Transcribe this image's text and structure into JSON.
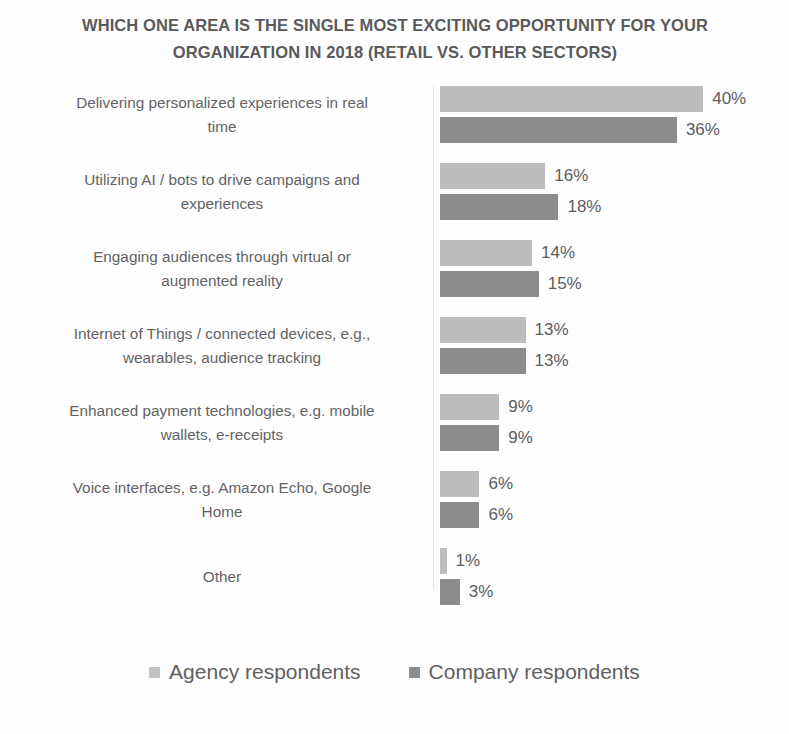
{
  "chart_data": {
    "type": "bar",
    "orientation": "horizontal",
    "title": "WHICH ONE AREA IS THE SINGLE MOST EXCITING OPPORTUNITY FOR YOUR ORGANIZATION IN 2018 (RETAIL VS. OTHER SECTORS)",
    "title_lines": [
      "WHICH ONE AREA IS THE SINGLE MOST EXCITING OPPORTUNITY FOR YOUR",
      "ORGANIZATION IN 2018 (RETAIL VS. OTHER SECTORS)"
    ],
    "xlabel": "",
    "ylabel": "",
    "xlim": [
      0,
      40
    ],
    "grid": false,
    "axis_visible": false,
    "value_suffix": "%",
    "legend_position": "bottom",
    "categories": [
      "Delivering personalized experiences in real time",
      "Utilizing AI / bots to drive campaigns and experiences",
      "Engaging audiences through virtual or augmented reality",
      "Internet of Things / connected devices, e.g., wearables, audience tracking",
      "Enhanced payment technologies, e.g. mobile wallets, e-receipts",
      "Voice interfaces, e.g. Amazon Echo, Google Home",
      "Other"
    ],
    "category_lines": [
      [
        "Delivering personalized experiences in real",
        "time"
      ],
      [
        "Utilizing AI / bots to drive campaigns and",
        "experiences"
      ],
      [
        "Engaging audiences through virtual or",
        "augmented reality"
      ],
      [
        "Internet of Things / connected devices, e.g.,",
        "wearables, audience tracking"
      ],
      [
        "Enhanced payment technologies, e.g. mobile",
        "wallets, e-receipts"
      ],
      [
        "Voice interfaces, e.g. Amazon Echo, Google",
        "Home"
      ],
      [
        "Other"
      ]
    ],
    "series": [
      {
        "name": "Agency respondents",
        "color": "#bcbcbc",
        "values": [
          40,
          16,
          14,
          13,
          9,
          6,
          1
        ],
        "value_labels": [
          "40%",
          "16%",
          "14%",
          "13%",
          "9%",
          "6%",
          "1%"
        ]
      },
      {
        "name": "Company respondents",
        "color": "#8c8c8c",
        "values": [
          36,
          18,
          15,
          13,
          9,
          6,
          3
        ],
        "value_labels": [
          "36%",
          "18%",
          "15%",
          "13%",
          "9%",
          "6%",
          "3%"
        ]
      }
    ],
    "legend": [
      {
        "label": "Agency respondents",
        "color": "#bcbcbc",
        "swatch": "legend-swatch-agency"
      },
      {
        "label": "Company respondents",
        "color": "#8c8c8c",
        "swatch": "legend-swatch-company"
      }
    ]
  },
  "colors": {
    "background": "#fefefe",
    "title_text": "#5a5a5c",
    "label_text": "#636365",
    "value_text": "#5d5d5f",
    "agency_bar": "#bcbcbc",
    "company_bar": "#8c8c8c",
    "axis_line": "#e6e6e6"
  }
}
